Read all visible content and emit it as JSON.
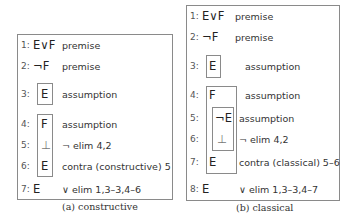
{
  "proofs": [
    {
      "id": "a",
      "caption": "(a) constructive",
      "lines": [
        {
          "num": "1:",
          "formula": "E∨F",
          "justification": "premise"
        },
        {
          "num": "2:",
          "formula": "¬F",
          "justification": "premise"
        },
        {
          "num": "3:",
          "formula": "E",
          "justification": "assumption"
        },
        {
          "num": "4:",
          "formula": "F",
          "justification": "assumption"
        },
        {
          "num": "5:",
          "formula": "⊥",
          "justification": "¬ elim 4,2"
        },
        {
          "num": "6:",
          "formula": "E",
          "justification": "contra (constructive) 5"
        },
        {
          "num": "7:",
          "formula": "E",
          "justification": "∨ elim 1,3–3,4–6"
        }
      ]
    },
    {
      "id": "b",
      "caption": "(b) classical",
      "lines": [
        {
          "num": "1:",
          "formula": "E∨F",
          "justification": "premise"
        },
        {
          "num": "2:",
          "formula": "¬F",
          "justification": "premise"
        },
        {
          "num": "3:",
          "formula": "E",
          "justification": "assumption"
        },
        {
          "num": "4:",
          "formula": "F",
          "justification": "assumption"
        },
        {
          "num": "5:",
          "formula": "¬E",
          "justification": "assumption"
        },
        {
          "num": "6:",
          "formula": "⊥",
          "justification": "¬ elim 4,2"
        },
        {
          "num": "7:",
          "formula": "E",
          "justification": "contra (classical) 5–6"
        },
        {
          "num": "8:",
          "formula": "E",
          "justification": "∨ elim 1,3–3,4–7"
        }
      ]
    }
  ]
}
